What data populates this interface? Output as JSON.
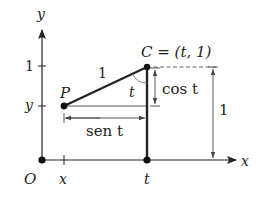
{
  "figure": {
    "colors": {
      "ink": "#222222",
      "thin": "#555555",
      "background": "#ffffff"
    },
    "axes": {
      "x_label": "x",
      "y_label": "y",
      "origin_label": "O",
      "x_ticks": [
        {
          "label": "x"
        },
        {
          "label": "t"
        }
      ],
      "y_ticks": [
        {
          "label": "1"
        },
        {
          "label": "y"
        }
      ]
    },
    "points": {
      "P": {
        "label": "P"
      },
      "C": {
        "label": "C = (t, 1)"
      },
      "T": {
        "label": "t"
      }
    },
    "segments": {
      "hypotenuse_label": "1",
      "angle_label": "t",
      "horizontal_dim_label": "sen t",
      "vertical_dim_label": "cos t",
      "height_dim_label": "1"
    }
  }
}
